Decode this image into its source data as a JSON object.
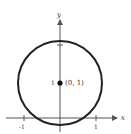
{
  "diagram": {
    "type": "circle-graph",
    "axes": {
      "x_label": "x",
      "y_label": "y"
    },
    "x_ticks": [
      {
        "value": -1,
        "label": "-1"
      },
      {
        "value": 1,
        "label": "1"
      }
    ],
    "y_ticks": [
      {
        "value": 1,
        "label": "1"
      },
      {
        "value": 2,
        "label": ""
      }
    ],
    "center_point": {
      "x": 0,
      "y": 1,
      "label": "(0, 1)"
    },
    "colors": {
      "stroke": "#222222",
      "axis": "#555555"
    }
  }
}
